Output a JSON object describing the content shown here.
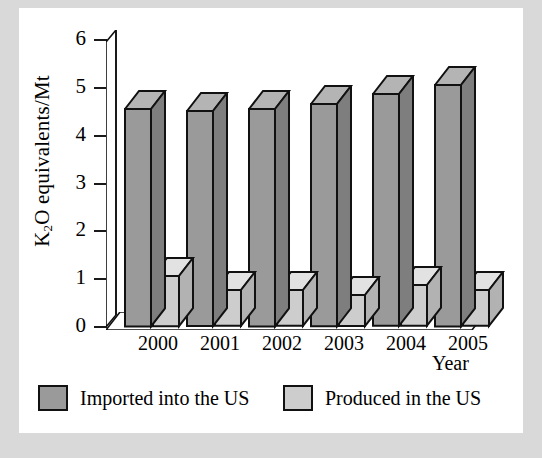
{
  "figure": {
    "background_color": "#d9d9d9",
    "plate_color": "#ffffff"
  },
  "chart_data": {
    "type": "bar",
    "title": "",
    "subtitle": "",
    "xlabel": "Year",
    "ylabel": "K2O equivalents/Mt",
    "ylabel_parts": {
      "pre": "K",
      "sub": "2",
      "post": "O equivalents/Mt"
    },
    "categories": [
      "2000",
      "2001",
      "2002",
      "2003",
      "2004",
      "2005"
    ],
    "ylim": [
      0,
      6
    ],
    "yticks": [
      0,
      1,
      2,
      3,
      4,
      5,
      6
    ],
    "ytick_labels": [
      "0",
      "1",
      "2",
      "3",
      "4",
      "5",
      "6"
    ],
    "grid": false,
    "style": "3d-column",
    "legend_position": "bottom",
    "series": [
      {
        "name": "Imported into the US",
        "color": "#9a9a9a",
        "top_color": "#b4b4b4",
        "side_color": "#7e7e7e",
        "values": [
          4.55,
          4.5,
          4.55,
          4.65,
          4.85,
          5.05
        ]
      },
      {
        "name": "Produced in the US",
        "color": "#cdcdcd",
        "top_color": "#e2e2e2",
        "side_color": "#b2b2b2",
        "values": [
          1.05,
          0.75,
          0.75,
          0.65,
          0.85,
          0.75
        ]
      }
    ]
  },
  "legend": {
    "items": [
      {
        "label": "Imported into the US",
        "color": "#9a9a9a"
      },
      {
        "label": "Produced in the US",
        "color": "#cdcdcd"
      }
    ]
  }
}
